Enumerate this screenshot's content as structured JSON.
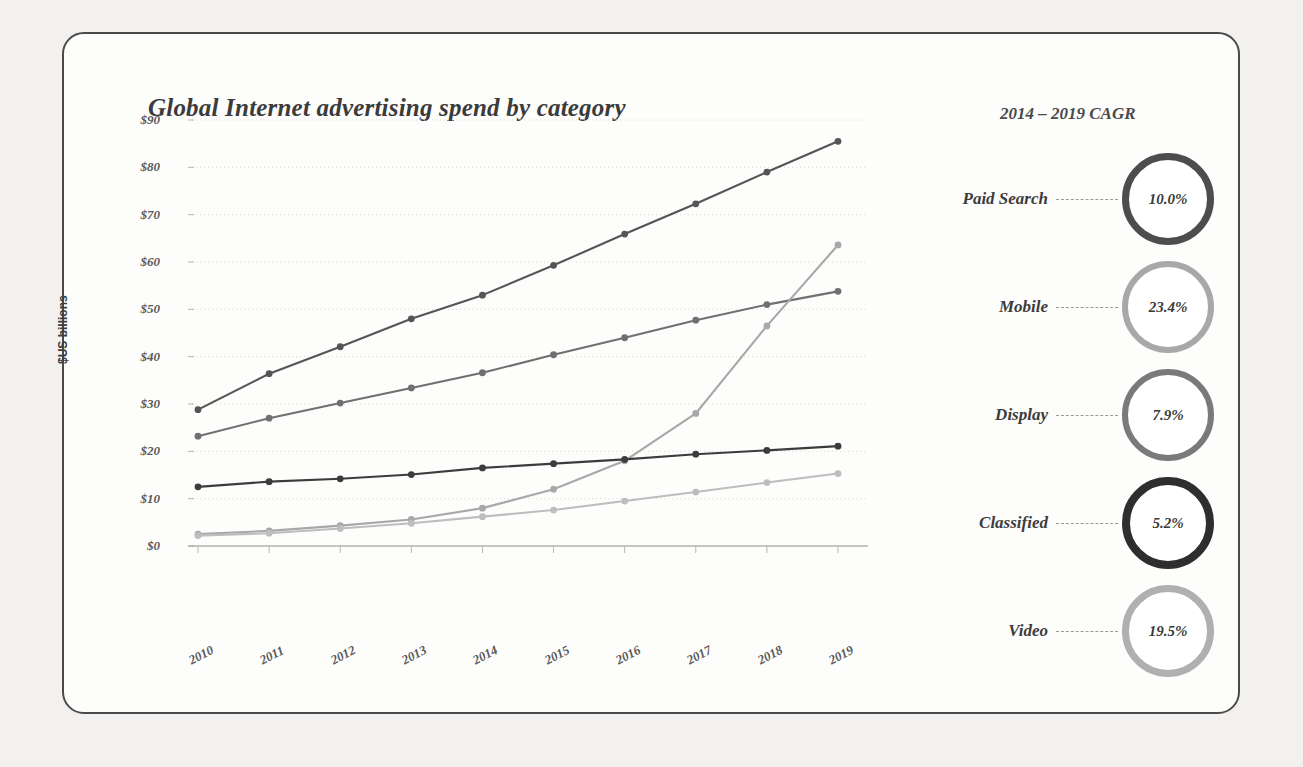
{
  "chart_data": {
    "type": "line",
    "title": "Global Internet advertising spend by category",
    "xlabel": "",
    "ylabel": "$US billions",
    "x": [
      "2010",
      "2011",
      "2012",
      "2013",
      "2014",
      "2015",
      "2016",
      "2017",
      "2018",
      "2019"
    ],
    "ylim": [
      0,
      90
    ],
    "yticks": [
      "$0",
      "$10",
      "$20",
      "$30",
      "$40",
      "$50",
      "$60",
      "$70",
      "$80",
      "$90"
    ],
    "ytick_values": [
      0,
      10,
      20,
      30,
      40,
      50,
      60,
      70,
      80,
      90
    ],
    "grid": true,
    "legend_position": "right-panel",
    "series": [
      {
        "name": "Paid Search",
        "color": "#555555",
        "values": [
          28.8,
          36.4,
          42.1,
          48.0,
          53.0,
          59.3,
          65.9,
          72.3,
          79.0,
          85.5
        ]
      },
      {
        "name": "Display",
        "color": "#707070",
        "values": [
          23.2,
          27.0,
          30.2,
          33.4,
          36.6,
          40.4,
          44.0,
          47.7,
          51.0,
          53.8
        ]
      },
      {
        "name": "Mobile",
        "color": "#a8a8a8",
        "values": [
          2.5,
          3.2,
          4.3,
          5.6,
          8.0,
          12.0,
          18.0,
          28.0,
          46.5,
          63.6
        ]
      },
      {
        "name": "Classified",
        "color": "#3c3c3c",
        "values": [
          12.5,
          13.6,
          14.2,
          15.1,
          16.5,
          17.4,
          18.3,
          19.4,
          20.2,
          21.1
        ]
      },
      {
        "name": "Video",
        "color": "#bdbdbd",
        "values": [
          2.2,
          2.7,
          3.7,
          4.8,
          6.2,
          7.6,
          9.5,
          11.4,
          13.4,
          15.3
        ]
      }
    ]
  },
  "cagr_panel": {
    "header": "2014 – 2019 CAGR",
    "items": [
      {
        "label": "Paid Search",
        "value": "10.0%",
        "ring_color": "#4d4d4d",
        "ring_width": 7
      },
      {
        "label": "Mobile",
        "value": "23.4%",
        "ring_color": "#a8a8a8",
        "ring_width": 6
      },
      {
        "label": "Display",
        "value": "7.9%",
        "ring_color": "#7a7a7a",
        "ring_width": 6
      },
      {
        "label": "Classified",
        "value": "5.2%",
        "ring_color": "#2e2e2e",
        "ring_width": 8
      },
      {
        "label": "Video",
        "value": "19.5%",
        "ring_color": "#b0b0b0",
        "ring_width": 7
      }
    ]
  },
  "colors": {
    "background": "#f2f1ef",
    "slide": "#fdfdfc",
    "border": "#4a4a4a",
    "text": "#3b3b3b",
    "grid": "#d8d8d4"
  }
}
